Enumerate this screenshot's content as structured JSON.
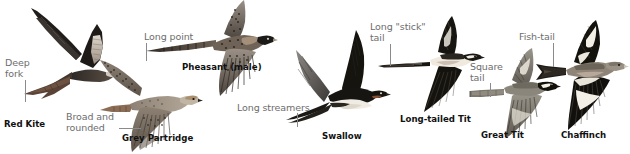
{
  "plate": {
    "title": "Bird flight silhouettes — tail shape identification plate",
    "background_color": "#ffffff",
    "label_color": "#6d6d6d",
    "name_color": "#111111",
    "leader_color": "#8a8a8a"
  },
  "birds": [
    {
      "id": "red-kite",
      "name": "Red Kite",
      "feature_label": "Deep\nfork",
      "feature_label_line1": "Deep",
      "feature_label_line2": "fork",
      "plumage": "dark brown body and wings, pale panel on inner primaries, grey head, deeply forked rufous tail",
      "pose": "wings raised in a shallow V, head to the right, forked tail to the left"
    },
    {
      "id": "grey-partridge",
      "name": "Grey Partridge",
      "feature_label": "Broad and\nrounded",
      "feature_label_line1": "Broad and",
      "feature_label_line2": "rounded",
      "plumage": "grey-brown barred body, mottled wings, orange face",
      "pose": "broad rounded wings bowed downward, head to the right, short tail"
    },
    {
      "id": "pheasant-male",
      "name": "Pheasant (male)",
      "feature_label": "Long point",
      "feature_label_line1": "Long point",
      "feature_label_line2": "",
      "plumage": "mottled chestnut body, dark head, very long pointed barred tail",
      "pose": "wings beating downward, head to the right, long tapering tail to the left"
    },
    {
      "id": "swallow",
      "name": "Swallow",
      "feature_label": "Long streamers",
      "feature_label_line1": "Long streamers",
      "feature_label_line2": "",
      "plumage": "blue-black upperparts, whitish underparts, very long thin outer tail streamers",
      "pose": "swept-back pointed wings in a V, head to the right, thin streamers to the left"
    },
    {
      "id": "long-tailed-tit",
      "name": "Long-tailed Tit",
      "feature_label": "Long \"stick\"\ntail",
      "feature_label_line1": "Long \"stick\"",
      "feature_label_line2": "tail",
      "plumage": "black and white with pinkish tones, tiny round body, very long narrow tail",
      "pose": "wings spread up and down, head to the right, long straight stick-like tail to the left"
    },
    {
      "id": "great-tit",
      "name": "Great Tit",
      "feature_label": "Square\ntail",
      "feature_label_line1": "Square",
      "feature_label_line2": "tail",
      "plumage": "grey-green wings, black head with white cheek, square-ended grey tail",
      "pose": "wings spread wide, head to the right, short square tail to the left"
    },
    {
      "id": "chaffinch",
      "name": "Chaffinch",
      "feature_label": "Fish-tail",
      "feature_label_line1": "Fish-tail",
      "feature_label_line2": "",
      "plumage": "black wings with bold white bars and shoulder patch, grey-brown body, notched tail",
      "pose": "wings spread wide, head to the right, notched fish-tail to the left"
    }
  ]
}
